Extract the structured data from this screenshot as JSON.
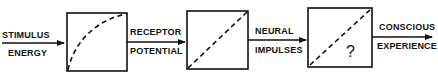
{
  "diagram": {
    "type": "flow",
    "stages": [
      {
        "input_label": [
          "STIMULUS",
          "ENERGY"
        ],
        "transfer": "concave-curve"
      },
      {
        "input_label": [
          "RECEPTOR",
          "POTENTIAL"
        ],
        "transfer": "linear"
      },
      {
        "input_label": [
          "NEURAL",
          "IMPULSES"
        ],
        "transfer": "linear",
        "marker": "?"
      }
    ],
    "output_label": [
      "CONSCIOUS",
      "EXPERIENCE"
    ],
    "labels": {
      "stimulus_1": "STIMULUS",
      "stimulus_2": "ENERGY",
      "receptor_1": "RECEPTOR",
      "receptor_2": "POTENTIAL",
      "neural_1": "NEURAL",
      "neural_2": "IMPULSES",
      "conscious_1": "CONSCIOUS",
      "conscious_2": "EXPERIENCE",
      "unknown_mark": "?"
    },
    "colors": {
      "ink": "#111111",
      "background": "#ffffff"
    }
  }
}
